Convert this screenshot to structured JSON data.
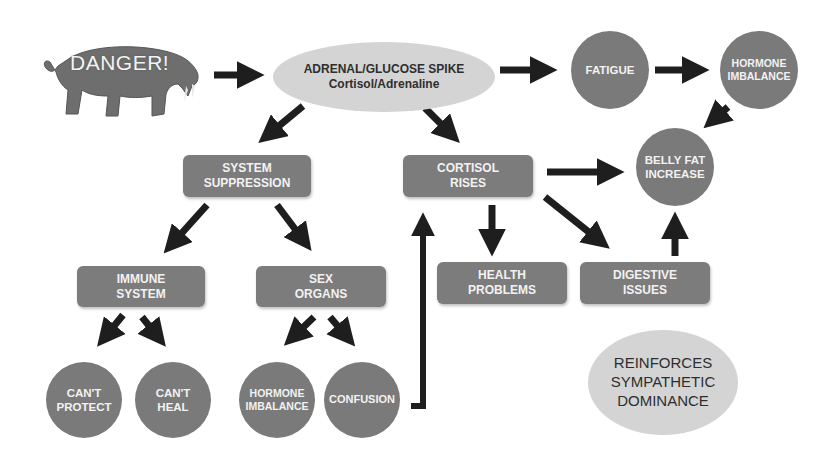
{
  "trigger": {
    "label": "DANGER!",
    "icon": "saber-tooth-tiger-image"
  },
  "spike": {
    "line1": "ADRENAL/GLUCOSE SPIKE",
    "line2": "Cortisol/Adrenaline"
  },
  "top_chain": {
    "fatigue": "FATIGUE",
    "hormone_imbalance": {
      "line1": "HORMONE",
      "line2": "IMBALANCE"
    }
  },
  "belly_fat": {
    "line1": "BELLY FAT",
    "line2": "INCREASE"
  },
  "system_suppression": {
    "line1": "SYSTEM",
    "line2": "SUPPRESSION"
  },
  "cortisol_rises": {
    "line1": "CORTISOL",
    "line2": "RISES"
  },
  "immune_system": {
    "line1": "IMMUNE",
    "line2": "SYSTEM"
  },
  "sex_organs": {
    "line1": "SEX",
    "line2": "ORGANS"
  },
  "health_problems": {
    "line1": "HEALTH",
    "line2": "PROBLEMS"
  },
  "digestive_issues": {
    "line1": "DIGESTIVE",
    "line2": "ISSUES"
  },
  "cant_protect": {
    "line1": "CAN'T",
    "line2": "PROTECT"
  },
  "cant_heal": {
    "line1": "CAN'T",
    "line2": "HEAL"
  },
  "bottom_hormone_imbalance": {
    "line1": "HORMONE",
    "line2": "IMBALANCE"
  },
  "confusion": "CONFUSION",
  "conclusion": {
    "line1": "REINFORCES",
    "line2": "SYMPATHETIC",
    "line3": "DOMINANCE"
  },
  "colors": {
    "node_dark": "#7a7a7a",
    "node_light": "#d4d4d4",
    "arrow": "#1e1e1e",
    "text_light": "#f2f2f2",
    "text_dark": "#2e2e2e"
  }
}
